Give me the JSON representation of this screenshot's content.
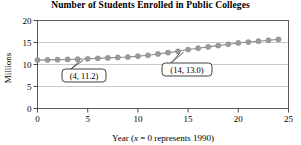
{
  "chart_data": {
    "type": "scatter",
    "title": "Number of Students Enrolled in Public Colleges",
    "xlabel_prefix": "Year (",
    "xlabel_italic": "x",
    "xlabel_suffix": " = 0 represents 1990)",
    "ylabel": "Millions",
    "xlim": [
      0,
      25
    ],
    "ylim": [
      0,
      20
    ],
    "xticks": [
      "0",
      "5",
      "10",
      "15",
      "20",
      "25"
    ],
    "xtick_values": [
      0,
      5,
      10,
      15,
      20,
      25
    ],
    "yticks": [
      "0",
      "5",
      "10",
      "15",
      "20"
    ],
    "ytick_values": [
      0,
      5,
      10,
      15,
      20
    ],
    "grid": true,
    "grid_axis": "y",
    "legend": "none",
    "marker_color": "#9a9a9a",
    "line_color": "#8c8c8c",
    "x": [
      0,
      1,
      2,
      3,
      4,
      5,
      6,
      7,
      8,
      9,
      10,
      11,
      12,
      13,
      14,
      15,
      16,
      17,
      18,
      19,
      20,
      21,
      22,
      23,
      24
    ],
    "values": [
      11.0,
      11.05,
      11.1,
      11.15,
      11.2,
      11.3,
      11.4,
      11.5,
      11.6,
      11.7,
      11.9,
      12.1,
      12.4,
      12.7,
      13.0,
      13.4,
      13.7,
      14.0,
      14.3,
      14.6,
      14.9,
      15.1,
      15.3,
      15.5,
      15.7
    ],
    "annotations": [
      {
        "label": "(4, 11.2)",
        "point_x": 4,
        "point_y": 11.2
      },
      {
        "label": "(14, 13.0)",
        "point_x": 14,
        "point_y": 13.0
      }
    ]
  }
}
